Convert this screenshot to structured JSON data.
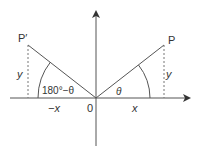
{
  "diagram": {
    "points": {
      "P": {
        "label": "P"
      },
      "P_prime": {
        "label": "P′"
      }
    },
    "labels": {
      "origin": "0",
      "x_right": "x",
      "x_left": "−x",
      "y_right": "y",
      "y_left": "y",
      "theta": "θ",
      "supplement": "180°−θ"
    },
    "colors": {
      "line": "#555555",
      "text": "#333333"
    }
  }
}
